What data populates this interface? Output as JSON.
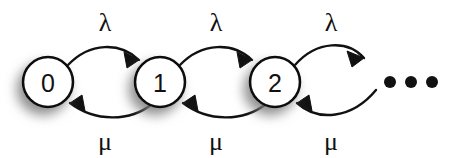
{
  "diagram": {
    "background_color": "#ffffff",
    "stroke_color": "#111111",
    "node_fill_color": "#ffffff",
    "nodes": [
      {
        "id": "state-0",
        "label": "0",
        "cx": 48,
        "cy": 82,
        "r": 25
      },
      {
        "id": "state-1",
        "label": "1",
        "cx": 160,
        "cy": 82,
        "r": 25
      },
      {
        "id": "state-2",
        "label": "2",
        "cx": 275,
        "cy": 82,
        "r": 25
      }
    ],
    "ellipsis": {
      "name": "states-continue-ellipsis",
      "dots": [
        {
          "cx": 390,
          "cy": 82,
          "r": 6
        },
        {
          "cx": 411,
          "cy": 82,
          "r": 6
        },
        {
          "cx": 432,
          "cy": 82,
          "r": 6
        }
      ]
    },
    "transitions": [
      {
        "id": "birth-0-1",
        "direction": "forward",
        "from": "state-0",
        "to": "state-1",
        "label": "λ",
        "label_x": 105,
        "label_y": 22,
        "path": "M 68 65 C 90 42, 120 42, 139 60",
        "arrow_points": "139,60 124,52 127,68"
      },
      {
        "id": "death-1-0",
        "direction": "backward",
        "from": "state-1",
        "to": "state-0",
        "label": "μ",
        "label_x": 105,
        "label_y": 141,
        "path": "M 152 104 C 130 122, 95 122, 70 103",
        "arrow_points": "70,103 85,111 82,95"
      },
      {
        "id": "birth-1-2",
        "direction": "forward",
        "from": "state-1",
        "to": "state-2",
        "label": "λ",
        "label_x": 216,
        "label_y": 22,
        "path": "M 180 65 C 202 42, 233 42, 252 60",
        "arrow_points": "252,60 237,52 240,68"
      },
      {
        "id": "death-2-1",
        "direction": "backward",
        "from": "state-2",
        "to": "state-1",
        "label": "μ",
        "label_x": 216,
        "label_y": 141,
        "path": "M 266 104 C 243 122, 208 122, 183 103",
        "arrow_points": "183,103 198,111 195,95"
      },
      {
        "id": "birth-2-next",
        "direction": "forward",
        "from": "state-2",
        "to": "states-continue-ellipsis",
        "label": "λ",
        "label_x": 331,
        "label_y": 22,
        "path": "M 295 65 C 317 40, 348 40, 364 58",
        "arrow_points": "364,58 347,51 352,67"
      },
      {
        "id": "death-next-2",
        "direction": "backward",
        "from": "states-continue-ellipsis",
        "to": "state-2",
        "label": "μ",
        "label_x": 331,
        "label_y": 141,
        "path": "M 376 90 C 352 119, 318 122, 297 103",
        "arrow_points": "297,103 312,111 309,95"
      }
    ]
  }
}
